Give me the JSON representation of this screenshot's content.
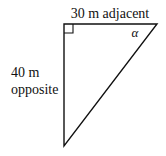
{
  "diagram": {
    "type": "right-triangle",
    "labels": {
      "top_side": "30 m adjacent",
      "left_side_line1": "40 m",
      "left_side_line2": "opposite",
      "angle": "α"
    },
    "vertices": {
      "right_angle": [
        64,
        24
      ],
      "angle_alpha": [
        157,
        24
      ],
      "bottom": [
        64,
        146
      ]
    },
    "colors": {
      "stroke": "#111111",
      "background": "#ffffff"
    }
  }
}
